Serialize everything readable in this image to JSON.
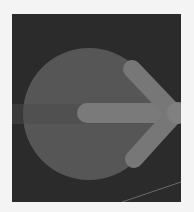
{
  "icon": {
    "name": "forward-arrow-button",
    "colors": {
      "tile": "#2a2a2a",
      "circle": "#5a5a5a",
      "arrow": "#7c7c7c",
      "page_background": "#f4f4f4"
    }
  }
}
